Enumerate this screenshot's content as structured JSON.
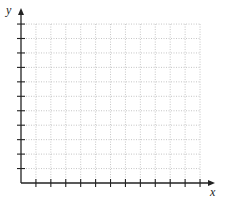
{
  "chart_data": {
    "type": "line",
    "title": "",
    "xlabel": "x",
    "ylabel": "y",
    "series": [],
    "x_ticks": 12,
    "y_ticks": 11,
    "tick_labels_shown": false,
    "grid": true,
    "grid_style": "dotted",
    "xlim": [
      0,
      12
    ],
    "ylim": [
      0,
      11
    ],
    "legend": null
  },
  "colors": {
    "axis": "#222222",
    "grid": "#b8b8b8",
    "background": "#ffffff"
  },
  "geometry": {
    "origin_x": 21,
    "origin_y": 183,
    "x_step": 14.92,
    "y_step": 14.45,
    "x_arrow_end": 215,
    "y_arrow_end": 8
  }
}
